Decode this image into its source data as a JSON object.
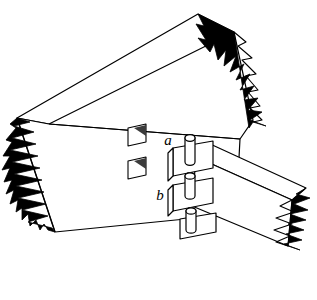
{
  "figure": {
    "background_color": "#ffffff",
    "line_color": "#000000",
    "fill_color": "#ffffff",
    "break_hatch_color": "#000000",
    "width": 317,
    "height": 300
  },
  "labels": [
    {
      "id": "label-a",
      "text": "a",
      "x": 168,
      "y": 145,
      "font_size": 15
    },
    {
      "id": "label-b",
      "text": "b",
      "x": 160,
      "y": 200,
      "font_size": 15
    }
  ],
  "parts": {
    "main_beam": {
      "name": "main-beam",
      "orientation": "upper-left to lower-right diagonal"
    },
    "cross_beam": {
      "name": "cross-beam",
      "orientation": "left to lower-right diagonal"
    },
    "mortise_holes": [
      {
        "name": "mortise-hole-upper"
      },
      {
        "name": "mortise-hole-lower"
      }
    ],
    "dowel_pins": [
      {
        "name": "dowel-pin-upper"
      },
      {
        "name": "dowel-pin-middle"
      },
      {
        "name": "dowel-pin-lower"
      }
    ],
    "broken_ends": [
      {
        "name": "break-top-right"
      },
      {
        "name": "break-left"
      },
      {
        "name": "break-bottom-right"
      }
    ]
  }
}
